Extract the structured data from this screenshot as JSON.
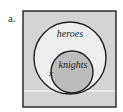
{
  "figure": {
    "label": "a.",
    "outer_set": {
      "label": "heroes"
    },
    "inner_set": {
      "label": "knights"
    },
    "mark": "x"
  },
  "colors": {
    "universe_fill": "#d4d4d4",
    "outer_fill": "#eeeeee",
    "inner_fill": "#bcbcbc",
    "stroke": "#222222",
    "divider": "#ffffff"
  }
}
